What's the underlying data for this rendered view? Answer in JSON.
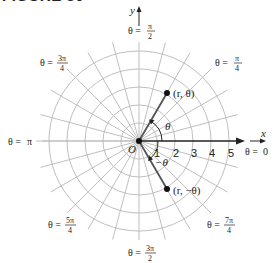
{
  "figure": {
    "header": "FIGURE 30"
  },
  "diagram": {
    "type": "polar-grid",
    "origin_label": "O",
    "x_axis_label": "x",
    "y_axis_label": "y",
    "radial_ticks": [
      "1",
      "2",
      "3",
      "4",
      "5"
    ],
    "grid": {
      "circles": 5,
      "radial_line_step_deg": 15
    },
    "angle_labels": {
      "theta_0": {
        "lhs": "θ =",
        "value": "0"
      },
      "theta_pi_4": {
        "lhs": "θ =",
        "num": "π",
        "den": "4"
      },
      "theta_pi_2": {
        "lhs": "θ =",
        "num": "π",
        "den": "2"
      },
      "theta_3pi_4": {
        "lhs": "θ =",
        "num": "3π",
        "den": "4"
      },
      "theta_pi": {
        "lhs": "θ =",
        "value": "π"
      },
      "theta_5pi_4": {
        "lhs": "θ =",
        "num": "5π",
        "den": "4"
      },
      "theta_3pi_2": {
        "lhs": "θ =",
        "num": "3π",
        "den": "2"
      },
      "theta_7pi_4": {
        "lhs": "θ =",
        "num": "7π",
        "den": "4"
      }
    },
    "points": [
      {
        "label": "(r, θ)",
        "r": 3,
        "theta_deg": 60
      },
      {
        "label": "(r, −θ)",
        "r": 3,
        "theta_deg": -60
      }
    ],
    "angle_arcs": {
      "positive": "θ",
      "negative": "−θ"
    },
    "colors": {
      "grid": "#b8b8b8",
      "axis": "#222222",
      "ray": "#555555",
      "point": "#111111"
    }
  }
}
